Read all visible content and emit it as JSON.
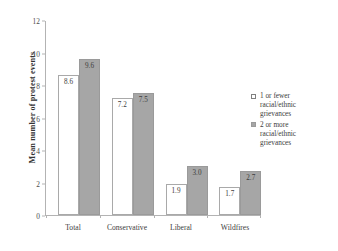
{
  "chart_data": {
    "type": "bar",
    "title": "",
    "xlabel": "",
    "ylabel": "Mean number of protest events",
    "categories": [
      "Total",
      "Conservative",
      "Liberal",
      "Wildfires"
    ],
    "series": [
      {
        "name": "1 or fewer racial/ethnic grievances",
        "values": [
          8.6,
          7.2,
          1.9,
          1.7
        ],
        "color": "#ffffff",
        "labels": [
          "8.6",
          "7.2",
          "1.9",
          "1.7"
        ]
      },
      {
        "name": "2 or more racial/ethnic grievances",
        "values": [
          9.6,
          7.5,
          3.0,
          2.7
        ],
        "color": "#a6a6a6",
        "labels": [
          "9.6",
          "7.5",
          "3.0",
          "2.7"
        ]
      }
    ],
    "ylim": [
      0,
      12
    ],
    "yticks": [
      "0",
      "2",
      "4",
      "6",
      "8",
      "10",
      "12"
    ],
    "grid": false,
    "legend_position": "right"
  },
  "legend": {
    "entries": [
      {
        "line1": "1 or fewer",
        "line2": "racial/ethnic",
        "line3": "grievances"
      },
      {
        "line1": "2 or more",
        "line2": "racial/ethnic",
        "line3": "grievances"
      }
    ]
  }
}
